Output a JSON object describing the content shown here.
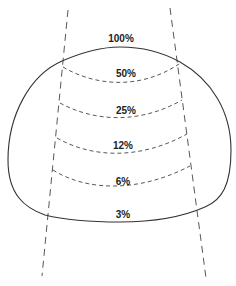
{
  "diagram": {
    "title": "",
    "colors": {
      "line": "#333333",
      "text": "#222222",
      "background": "#ffffff"
    },
    "surface_label": "100%",
    "contours": [
      {
        "label": "50%"
      },
      {
        "label": "25%"
      },
      {
        "label": "12%"
      },
      {
        "label": "6%"
      }
    ],
    "exit_label": "3%"
  }
}
